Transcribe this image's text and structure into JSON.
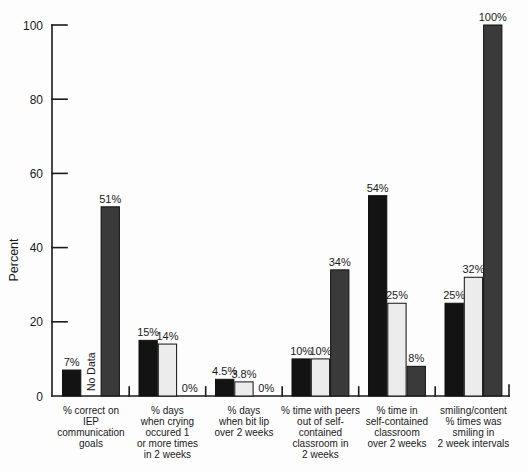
{
  "chart_data": {
    "type": "bar",
    "title": "",
    "xlabel": "",
    "ylabel": "Percent",
    "ylim": [
      0,
      100
    ],
    "yticks": [
      0,
      20,
      40,
      60,
      80,
      100
    ],
    "grid": false,
    "legend": "none",
    "categories": [
      [
        "% correct on",
        "IEP",
        "communication",
        "goals"
      ],
      [
        "% days",
        "when crying",
        "occured 1",
        "or more times",
        "in 2 weeks"
      ],
      [
        "% days",
        "when bit lip",
        "over 2 weeks"
      ],
      [
        "% time with peers",
        "out of self-",
        "contained",
        "classroom in",
        "2 weeks"
      ],
      [
        "% time in",
        "self-contained",
        "classroom",
        "over 2 weeks"
      ],
      [
        "smiling/content",
        "% times was",
        "smiling in",
        "2 week intervals"
      ]
    ],
    "series": [
      {
        "name": "black-bars",
        "color": "#131313",
        "values": [
          7,
          15,
          4.5,
          10,
          54,
          25
        ],
        "bar_labels": [
          "7%",
          "15%",
          "4.5%",
          "10%",
          "54%",
          "25%"
        ]
      },
      {
        "name": "light-gray-bars",
        "color": "#ececec",
        "values": [
          null,
          14,
          3.8,
          10,
          25,
          32
        ],
        "bar_labels": [
          "No Data",
          "14%",
          "3.8%",
          "10%",
          "25%",
          "32%"
        ]
      },
      {
        "name": "dark-gray-bars",
        "color": "#3a3a3a",
        "values": [
          51,
          0,
          0,
          34,
          8,
          100
        ],
        "bar_labels": [
          "51%",
          "0%",
          "0%",
          "34%",
          "8%",
          "100%"
        ]
      }
    ],
    "annotations": [
      {
        "text": "No Data",
        "rotation_deg": 90,
        "category_index": 0,
        "series_index": 1
      }
    ],
    "axis_color": "#1a1a1a"
  }
}
